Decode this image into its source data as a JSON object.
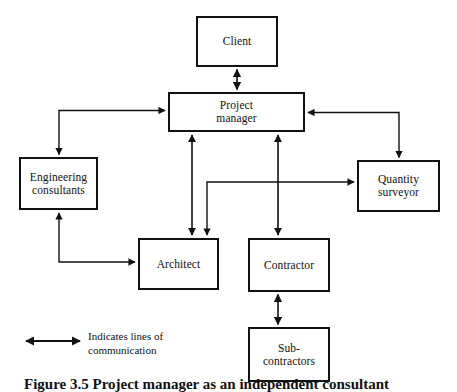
{
  "diagram": {
    "line_color": "#111111",
    "box_border_color": "#111111",
    "background_color": "#ffffff",
    "nodes": [
      {
        "id": "client",
        "label": "Client",
        "x": 196,
        "y": 16,
        "w": 82,
        "h": 51
      },
      {
        "id": "project_mgr",
        "label": "Project\nmanager",
        "x": 168,
        "y": 92,
        "w": 137,
        "h": 40
      },
      {
        "id": "eng_cons",
        "label": "Engineering\nconsultants",
        "x": 19,
        "y": 157,
        "w": 79,
        "h": 53
      },
      {
        "id": "qty_surv",
        "label": "Quantity\nsurveyor",
        "x": 357,
        "y": 160,
        "w": 83,
        "h": 52
      },
      {
        "id": "architect",
        "label": "Architect",
        "x": 138,
        "y": 238,
        "w": 81,
        "h": 52
      },
      {
        "id": "contractor",
        "label": "Contractor",
        "x": 248,
        "y": 238,
        "w": 82,
        "h": 54
      },
      {
        "id": "subcontract",
        "label": "Sub-\ncontractors",
        "x": 248,
        "y": 327,
        "w": 82,
        "h": 55
      }
    ],
    "connections": [
      {
        "from": "client",
        "to": "project_mgr",
        "arrows": "both"
      },
      {
        "from": "project_mgr",
        "to": "eng_cons",
        "arrows": "both"
      },
      {
        "from": "project_mgr",
        "to": "qty_surv",
        "arrows": "both"
      },
      {
        "from": "project_mgr",
        "to": "architect",
        "arrows": "both"
      },
      {
        "from": "project_mgr",
        "to": "contractor",
        "arrows": "both"
      },
      {
        "from": "eng_cons",
        "to": "architect",
        "arrows": "both"
      },
      {
        "from": "architect",
        "to": "qty_surv",
        "arrows": "both"
      },
      {
        "from": "contractor",
        "to": "subcontract",
        "arrows": "both"
      }
    ]
  },
  "legend": {
    "line_1": "Indicates lines of",
    "line_2": "communication",
    "symbol_name": "double-headed-arrow"
  },
  "caption": {
    "text": "Figure 3.5 Project manager as an independent consultant"
  }
}
